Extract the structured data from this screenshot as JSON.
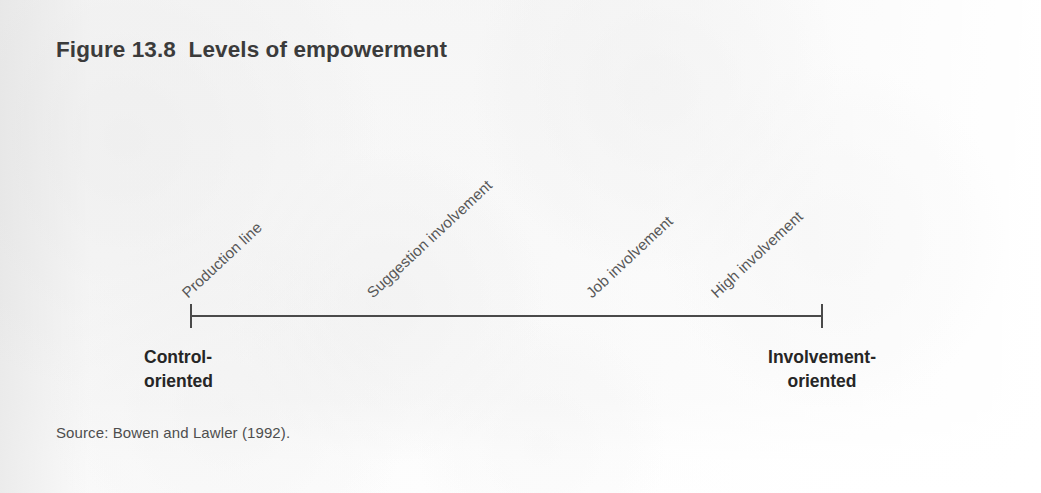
{
  "figure": {
    "title": "Figure 13.8  Levels of empowerment",
    "source": "Source: Bowen and Lawler (1992)."
  },
  "axis": {
    "left_pole": "Control-\noriented",
    "right_pole": "Involvement-\noriented"
  },
  "chart_data": {
    "type": "line",
    "title": "Figure 13.8  Levels of empowerment",
    "subtitle": "",
    "xlabel": "",
    "ylabel": "",
    "orientation": "horizontal",
    "axis_endpoints": [
      "Control-oriented",
      "Involvement-oriented"
    ],
    "categories": [
      "Production line",
      "Suggestion involvement",
      "Job involvement",
      "High involvement"
    ],
    "values": [
      1,
      2,
      3,
      4
    ],
    "annotations": [
      "Production line",
      "Suggestion involvement",
      "Job involvement",
      "High involvement"
    ],
    "legend": [],
    "grid": false,
    "source": "Source: Bowen and Lawler (1992)."
  },
  "stages": [
    {
      "label": "Production line",
      "x": 190,
      "y": 300
    },
    {
      "label": "Suggestion involvement",
      "x": 375,
      "y": 300
    },
    {
      "label": "Job involvement",
      "x": 594,
      "y": 300
    },
    {
      "label": "High involvement",
      "x": 719,
      "y": 300
    }
  ],
  "colors": {
    "page_background": "#f7f7f7",
    "title_text": "#3b3b3b",
    "stage_text": "#575757",
    "pole_text": "#262626",
    "axis_stroke": "#4a4a4a",
    "source_text": "#4e4e4e"
  }
}
